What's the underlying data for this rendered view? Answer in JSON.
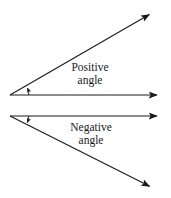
{
  "figure": {
    "background_color": "#ffffff",
    "stroke_color": "#1a1a1a",
    "text_color": "#1a1a1a",
    "width": 171,
    "height": 198,
    "labels": {
      "positive": {
        "line1": "Positive",
        "line2": "angle"
      },
      "negative": {
        "line1": "Negative",
        "line2": "angle"
      }
    },
    "diagrams": [
      {
        "name": "positive-angle",
        "vertex": [
          10,
          95
        ],
        "initial_ray_end": [
          160,
          95
        ],
        "terminal_ray_end": [
          152,
          13
        ],
        "rotation": "counterclockwise",
        "arc_sweep_direction": "up"
      },
      {
        "name": "negative-angle",
        "vertex": [
          10,
          116
        ],
        "initial_ray_end": [
          160,
          116
        ],
        "terminal_ray_end": [
          152,
          188
        ],
        "rotation": "clockwise",
        "arc_sweep_direction": "down"
      }
    ]
  }
}
